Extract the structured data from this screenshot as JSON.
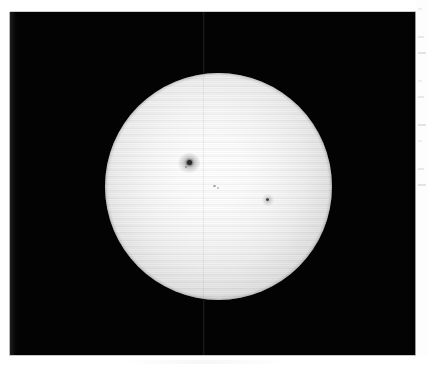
{
  "image": {
    "subject": "The Sun",
    "description": "Black-and-white photographic plate of the full solar disk showing limb darkening and three sunspot groups",
    "medium": "scanned monochrome photograph",
    "canvas": {
      "width": 428,
      "height": 371
    }
  },
  "plate": {
    "name": "photographic-plate",
    "background_color": "#030303",
    "left": 10,
    "top": 12,
    "width": 406,
    "height": 344,
    "seam_x": 203,
    "seam_color": "#1e1e1e"
  },
  "solar_disk": {
    "name": "solar-disk",
    "center_x": 218,
    "center_y": 186,
    "diameter": 227,
    "core_color": "#ffffff",
    "mid_color": "#e4e4e4",
    "limb_color": "#8e8e8e",
    "limb_darkening": "true"
  },
  "sunspots": [
    {
      "id": "sunspot-group-main",
      "label": "main sunspot group",
      "center_x": 189,
      "center_y": 163,
      "umbra_color": "#2b2b2b",
      "penumbra_color": "#5a5a5a",
      "size": "large"
    },
    {
      "id": "sunspot-pore-center",
      "label": "central pore pair",
      "center_x": 215,
      "center_y": 187,
      "umbra_color": "#a8a8a8",
      "penumbra_color": "#c8c8c8",
      "size": "small"
    },
    {
      "id": "sunspot-east",
      "label": "eastern sunspot",
      "center_x": 268,
      "center_y": 200,
      "umbra_color": "#4a4a4a",
      "penumbra_color": "#8a8a8a",
      "size": "medium"
    }
  ],
  "margins": {
    "name": "paper-margin",
    "color": "#ffffff",
    "top": 12,
    "left": 10,
    "right": 12,
    "bottom": 15,
    "tick_count": 9,
    "tick_color": "#dcdcdc"
  }
}
